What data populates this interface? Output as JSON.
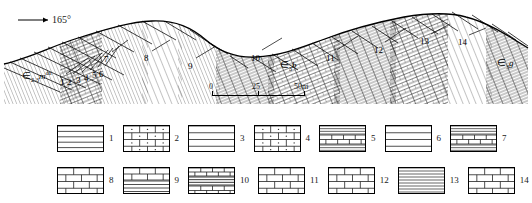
{
  "figure": {
    "type": "geological-cross-section",
    "azimuth_label": "165°",
    "azimuth_arrow": "arrow-right-icon"
  },
  "cross_section": {
    "bed_labels": [
      {
        "n": "1",
        "x": 60,
        "y": 78,
        "lx": 64,
        "ly": 74,
        "tx": 86,
        "ty": 56
      },
      {
        "n": "2",
        "x": 67,
        "y": 78,
        "lx": 71,
        "ly": 74,
        "tx": 92,
        "ty": 54
      },
      {
        "n": "3",
        "x": 76,
        "y": 76,
        "lx": 80,
        "ly": 72,
        "tx": 99,
        "ty": 51
      },
      {
        "n": "4",
        "x": 84,
        "y": 74,
        "lx": 88,
        "ly": 70,
        "tx": 105,
        "ty": 48
      },
      {
        "n": "5",
        "x": 92,
        "y": 71,
        "lx": 96,
        "ly": 67,
        "tx": 110,
        "ty": 46
      },
      {
        "n": "6",
        "x": 99,
        "y": 70,
        "lx": 103,
        "ly": 66,
        "tx": 116,
        "ty": 44
      },
      {
        "n": "7",
        "x": 104,
        "y": 55,
        "lx": 109,
        "ly": 52,
        "tx": 124,
        "ty": 38
      },
      {
        "n": "8",
        "x": 144,
        "y": 54,
        "lx": 149,
        "ly": 51,
        "tx": 166,
        "ty": 38
      },
      {
        "n": "9",
        "x": 188,
        "y": 62,
        "lx": 193,
        "ly": 58,
        "tx": 212,
        "ty": 44
      },
      {
        "n": "10",
        "x": 251,
        "y": 54,
        "lx": 258,
        "ly": 50,
        "tx": 278,
        "ty": 36
      },
      {
        "n": "11",
        "x": 326,
        "y": 54,
        "lx": 333,
        "ly": 50,
        "tx": 354,
        "ty": 34
      },
      {
        "n": "12",
        "x": 374,
        "y": 46,
        "lx": 381,
        "ly": 42,
        "tx": 402,
        "ty": 26
      },
      {
        "n": "13",
        "x": 420,
        "y": 37,
        "lx": 427,
        "ly": 34,
        "tx": 446,
        "ty": 22
      },
      {
        "n": "14",
        "x": 458,
        "y": 38,
        "lx": 465,
        "ly": 35,
        "tx": 482,
        "ty": 26
      }
    ],
    "unit_symbols": [
      {
        "id": "left-unit",
        "cambrian": "∈",
        "sub": "2-3",
        "letter": "m",
        "sup": "dn",
        "x": 22,
        "y": 70
      },
      {
        "id": "middle-unit",
        "cambrian": "∈",
        "sub": "3",
        "letter": "b",
        "sup": "",
        "x": 280,
        "y": 60
      },
      {
        "id": "right-unit",
        "cambrian": "∈",
        "sub": "3",
        "letter": "g",
        "sup": "",
        "x": 497,
        "y": 58
      }
    ]
  },
  "scale": {
    "ticks": [
      "0",
      "25",
      "50m"
    ],
    "tick_positions": [
      0,
      46,
      92
    ]
  },
  "legend": {
    "row1": [
      {
        "num": "1",
        "pattern": "horizontal-lines"
      },
      {
        "num": "2",
        "pattern": "dolomite-brick-dots"
      },
      {
        "num": "3",
        "pattern": "horizontal-lines-wide"
      },
      {
        "num": "4",
        "pattern": "dolomite-brick-dots"
      },
      {
        "num": "5",
        "pattern": "banded-lines-brick"
      },
      {
        "num": "6",
        "pattern": "horizontal-lines-wide"
      },
      {
        "num": "7",
        "pattern": "banded-lines-brick"
      }
    ],
    "row2": [
      {
        "num": "8",
        "pattern": "limestone-brick"
      },
      {
        "num": "9",
        "pattern": "brick-over-lines"
      },
      {
        "num": "10",
        "pattern": "banded-brick-lines"
      },
      {
        "num": "11",
        "pattern": "limestone-brick"
      },
      {
        "num": "12",
        "pattern": "limestone-brick"
      },
      {
        "num": "13",
        "pattern": "dense-horizontal-lines"
      },
      {
        "num": "14",
        "pattern": "limestone-brick"
      }
    ]
  },
  "colors": {
    "ink": "#000000",
    "paper": "#ffffff",
    "hatch": "#2b2b2b"
  }
}
